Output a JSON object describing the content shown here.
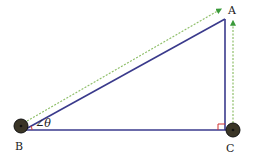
{
  "diagram": {
    "type": "right-triangle",
    "labels": {
      "A": "A",
      "B": "B",
      "C": "C",
      "angle": "∠θ"
    },
    "colors": {
      "triangle": "#3a3a8c",
      "dashed_arrows": "#3a9a3a",
      "right_angle_marker": "#d03030",
      "node_fill": "#3a3526",
      "node_ring": "#111111"
    },
    "nodes": [
      {
        "id": "B",
        "kind": "circle-node"
      },
      {
        "id": "C",
        "kind": "circle-node"
      }
    ],
    "arrows": [
      {
        "from": "B",
        "to": "A-direction",
        "style": "dashed"
      },
      {
        "from": "C",
        "to": "A",
        "style": "dashed"
      }
    ]
  }
}
